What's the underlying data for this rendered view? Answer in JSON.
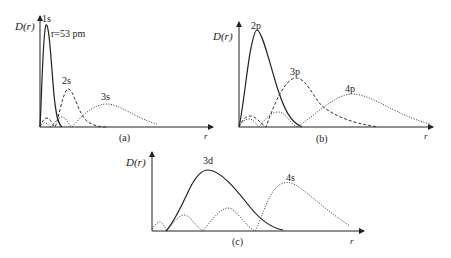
{
  "figure": {
    "panels": [
      {
        "id": "a",
        "caption": "(a)",
        "ylabel": "D(r)",
        "xlabel": "r",
        "annotation": "r=53 pm",
        "curves": [
          {
            "label": "1s",
            "style": "solid"
          },
          {
            "label": "2s",
            "style": "dashed"
          },
          {
            "label": "3s",
            "style": "dotted"
          }
        ]
      },
      {
        "id": "b",
        "caption": "(b)",
        "ylabel": "D(r)",
        "xlabel": "r",
        "curves": [
          {
            "label": "2p",
            "style": "solid"
          },
          {
            "label": "3p",
            "style": "dashed"
          },
          {
            "label": "4p",
            "style": "dotted"
          }
        ]
      },
      {
        "id": "c",
        "caption": "(c)",
        "ylabel": "D(r)",
        "xlabel": "r",
        "curves": [
          {
            "label": "3d",
            "style": "solid"
          },
          {
            "label": "4s",
            "style": "dotted"
          }
        ]
      }
    ]
  }
}
